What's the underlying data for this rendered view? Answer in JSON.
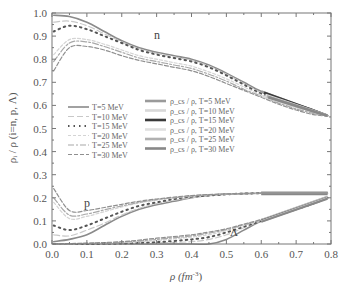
{
  "chart_data": {
    "type": "line",
    "title": "",
    "xlabel": "ρ (fm⁻³)",
    "ylabel": "ρᵢ / ρ (i=n, p, Λ)",
    "xlim": [
      0.0,
      0.8
    ],
    "ylim": [
      0.0,
      1.0
    ],
    "xticks": [
      "0.0",
      "0.1",
      "0.2",
      "0.3",
      "0.4",
      "0.5",
      "0.6",
      "0.7",
      "0.8"
    ],
    "yticks": [
      "0.0",
      "0.1",
      "0.2",
      "0.3",
      "0.4",
      "0.5",
      "0.6",
      "0.7",
      "0.8",
      "0.9",
      "1.0"
    ],
    "grid": false,
    "annotations": [
      {
        "text": "n",
        "x": 0.3,
        "y": 0.915
      },
      {
        "text": "p",
        "x": 0.1,
        "y": 0.175
      },
      {
        "text": "Λ",
        "x": 0.52,
        "y": 0.055
      }
    ],
    "legend_left": [
      {
        "label": "T=5 MeV",
        "style": "solid"
      },
      {
        "label": "T=10 MeV",
        "style": "dash"
      },
      {
        "label": "T=15 MeV",
        "style": "dot"
      },
      {
        "label": "T=20 MeV",
        "style": "short-dash"
      },
      {
        "label": "T=25 MeV",
        "style": "dash-dot"
      },
      {
        "label": "T=30 MeV",
        "style": "dash-long"
      }
    ],
    "legend_right": [
      {
        "label": "ρ_cs / ρ, T=5 MeV"
      },
      {
        "label": "ρ_cs / ρ, T=10 MeV"
      },
      {
        "label": "ρ_cs / ρ, T=15 MeV"
      },
      {
        "label": "ρ_cs / ρ, T=20 MeV"
      },
      {
        "label": "ρ_cs / ρ, T=25 MeV"
      },
      {
        "label": "ρ_cs / ρ, T=30 MeV"
      }
    ],
    "series": [
      {
        "name": "n, T=5 MeV",
        "x": [
          0.005,
          0.05,
          0.1,
          0.15,
          0.2,
          0.25,
          0.3,
          0.35,
          0.4,
          0.45,
          0.5,
          0.55,
          0.6,
          0.65,
          0.7,
          0.75,
          0.79
        ],
        "y": [
          0.99,
          0.985,
          0.96,
          0.92,
          0.88,
          0.85,
          0.83,
          0.815,
          0.8,
          0.775,
          0.74,
          0.7,
          0.66,
          0.63,
          0.605,
          0.58,
          0.555
        ]
      },
      {
        "name": "n, T=10 MeV",
        "x": [
          0.005,
          0.05,
          0.1,
          0.15,
          0.2,
          0.25,
          0.3,
          0.35,
          0.4,
          0.45,
          0.5,
          0.55,
          0.6,
          0.65,
          0.7,
          0.75,
          0.79
        ],
        "y": [
          0.96,
          0.965,
          0.945,
          0.91,
          0.875,
          0.845,
          0.825,
          0.81,
          0.795,
          0.77,
          0.735,
          0.695,
          0.655,
          0.625,
          0.6,
          0.575,
          0.555
        ]
      },
      {
        "name": "n, T=15 MeV",
        "x": [
          0.005,
          0.05,
          0.1,
          0.15,
          0.2,
          0.25,
          0.3,
          0.35,
          0.4,
          0.45,
          0.5,
          0.55,
          0.6,
          0.65,
          0.7,
          0.75,
          0.79
        ],
        "y": [
          0.92,
          0.945,
          0.93,
          0.9,
          0.87,
          0.84,
          0.82,
          0.805,
          0.79,
          0.765,
          0.73,
          0.69,
          0.65,
          0.62,
          0.595,
          0.57,
          0.555
        ]
      },
      {
        "name": "n, T=20 MeV",
        "x": [
          0.005,
          0.05,
          0.1,
          0.15,
          0.2,
          0.25,
          0.3,
          0.35,
          0.4,
          0.45,
          0.5,
          0.55,
          0.6,
          0.65,
          0.7,
          0.75,
          0.79
        ],
        "y": [
          0.82,
          0.885,
          0.885,
          0.865,
          0.84,
          0.815,
          0.8,
          0.785,
          0.77,
          0.745,
          0.715,
          0.68,
          0.645,
          0.615,
          0.59,
          0.565,
          0.555
        ]
      },
      {
        "name": "n, T=25 MeV",
        "x": [
          0.005,
          0.05,
          0.1,
          0.15,
          0.2,
          0.25,
          0.3,
          0.35,
          0.4,
          0.45,
          0.5,
          0.55,
          0.6,
          0.65,
          0.7,
          0.75,
          0.79
        ],
        "y": [
          0.79,
          0.87,
          0.875,
          0.855,
          0.83,
          0.805,
          0.79,
          0.775,
          0.76,
          0.735,
          0.705,
          0.67,
          0.64,
          0.61,
          0.585,
          0.565,
          0.555
        ]
      },
      {
        "name": "n, T=30 MeV",
        "x": [
          0.005,
          0.05,
          0.1,
          0.15,
          0.2,
          0.25,
          0.3,
          0.35,
          0.4,
          0.45,
          0.5,
          0.55,
          0.6,
          0.65,
          0.7,
          0.75,
          0.79
        ],
        "y": [
          0.75,
          0.85,
          0.855,
          0.84,
          0.815,
          0.795,
          0.78,
          0.765,
          0.75,
          0.725,
          0.695,
          0.665,
          0.635,
          0.605,
          0.58,
          0.56,
          0.555
        ]
      },
      {
        "name": "p, T=5 MeV",
        "x": [
          0.005,
          0.05,
          0.1,
          0.15,
          0.2,
          0.25,
          0.3,
          0.35,
          0.4,
          0.45,
          0.5,
          0.55,
          0.6,
          0.65,
          0.7,
          0.75,
          0.79
        ],
        "y": [
          0.01,
          0.02,
          0.04,
          0.08,
          0.12,
          0.15,
          0.17,
          0.185,
          0.2,
          0.21,
          0.215,
          0.218,
          0.22,
          0.22,
          0.22,
          0.22,
          0.22
        ]
      },
      {
        "name": "p, T=10 MeV",
        "x": [
          0.005,
          0.05,
          0.1,
          0.15,
          0.2,
          0.25,
          0.3,
          0.35,
          0.4,
          0.45,
          0.5,
          0.55,
          0.6,
          0.65,
          0.7,
          0.75,
          0.79
        ],
        "y": [
          0.04,
          0.035,
          0.06,
          0.09,
          0.125,
          0.155,
          0.175,
          0.19,
          0.2,
          0.21,
          0.215,
          0.218,
          0.22,
          0.22,
          0.22,
          0.22,
          0.22
        ]
      },
      {
        "name": "p, T=15 MeV",
        "x": [
          0.005,
          0.05,
          0.1,
          0.15,
          0.2,
          0.25,
          0.3,
          0.35,
          0.4,
          0.45,
          0.5,
          0.55,
          0.6,
          0.65,
          0.7,
          0.75,
          0.79
        ],
        "y": [
          0.08,
          0.06,
          0.08,
          0.11,
          0.14,
          0.165,
          0.18,
          0.195,
          0.205,
          0.21,
          0.215,
          0.218,
          0.22,
          0.22,
          0.22,
          0.22,
          0.22
        ]
      },
      {
        "name": "p, T=20 MeV",
        "x": [
          0.005,
          0.05,
          0.1,
          0.15,
          0.2,
          0.25,
          0.3,
          0.35,
          0.4,
          0.45,
          0.5,
          0.55,
          0.6,
          0.65,
          0.7,
          0.75,
          0.79
        ],
        "y": [
          0.18,
          0.11,
          0.12,
          0.14,
          0.16,
          0.178,
          0.19,
          0.2,
          0.207,
          0.212,
          0.216,
          0.218,
          0.22,
          0.22,
          0.22,
          0.22,
          0.22
        ]
      },
      {
        "name": "p, T=25 MeV",
        "x": [
          0.005,
          0.05,
          0.1,
          0.15,
          0.2,
          0.25,
          0.3,
          0.35,
          0.4,
          0.45,
          0.5,
          0.55,
          0.6,
          0.65,
          0.7,
          0.75,
          0.79
        ],
        "y": [
          0.2,
          0.125,
          0.13,
          0.148,
          0.165,
          0.18,
          0.192,
          0.2,
          0.208,
          0.213,
          0.216,
          0.218,
          0.22,
          0.22,
          0.22,
          0.22,
          0.22
        ]
      },
      {
        "name": "p, T=30 MeV",
        "x": [
          0.005,
          0.05,
          0.1,
          0.15,
          0.2,
          0.25,
          0.3,
          0.35,
          0.4,
          0.45,
          0.5,
          0.55,
          0.6,
          0.65,
          0.7,
          0.75,
          0.79
        ],
        "y": [
          0.24,
          0.145,
          0.145,
          0.158,
          0.172,
          0.185,
          0.195,
          0.203,
          0.21,
          0.214,
          0.217,
          0.219,
          0.22,
          0.22,
          0.22,
          0.22,
          0.22
        ]
      },
      {
        "name": "Λ, T=5 MeV",
        "x": [
          0.005,
          0.1,
          0.2,
          0.3,
          0.4,
          0.45,
          0.5,
          0.55,
          0.6,
          0.65,
          0.7,
          0.75,
          0.79
        ],
        "y": [
          0.0,
          0.0,
          0.0,
          0.0,
          0.0,
          0.0,
          0.02,
          0.06,
          0.1,
          0.125,
          0.15,
          0.175,
          0.2
        ]
      },
      {
        "name": "Λ, T=10 MeV",
        "x": [
          0.005,
          0.1,
          0.2,
          0.3,
          0.4,
          0.45,
          0.5,
          0.55,
          0.6,
          0.65,
          0.7,
          0.75,
          0.79
        ],
        "y": [
          0.0,
          0.0,
          0.0,
          0.005,
          0.01,
          0.02,
          0.04,
          0.07,
          0.1,
          0.125,
          0.15,
          0.175,
          0.2
        ]
      },
      {
        "name": "Λ, T=15 MeV",
        "x": [
          0.005,
          0.1,
          0.2,
          0.3,
          0.4,
          0.45,
          0.5,
          0.55,
          0.6,
          0.65,
          0.7,
          0.75,
          0.79
        ],
        "y": [
          0.0,
          0.0,
          0.002,
          0.008,
          0.02,
          0.03,
          0.05,
          0.075,
          0.1,
          0.125,
          0.15,
          0.175,
          0.2
        ]
      },
      {
        "name": "Λ, T=20 MeV",
        "x": [
          0.005,
          0.1,
          0.2,
          0.3,
          0.4,
          0.45,
          0.5,
          0.55,
          0.6,
          0.65,
          0.7,
          0.75,
          0.79
        ],
        "y": [
          0.0,
          0.002,
          0.006,
          0.015,
          0.03,
          0.04,
          0.058,
          0.08,
          0.102,
          0.126,
          0.15,
          0.175,
          0.2
        ]
      },
      {
        "name": "Λ, T=25 MeV",
        "x": [
          0.005,
          0.1,
          0.2,
          0.3,
          0.4,
          0.45,
          0.5,
          0.55,
          0.6,
          0.65,
          0.7,
          0.75,
          0.79
        ],
        "y": [
          0.0,
          0.003,
          0.008,
          0.02,
          0.035,
          0.047,
          0.062,
          0.083,
          0.104,
          0.127,
          0.15,
          0.175,
          0.2
        ]
      },
      {
        "name": "Λ, T=30 MeV",
        "x": [
          0.005,
          0.1,
          0.2,
          0.3,
          0.4,
          0.45,
          0.5,
          0.55,
          0.6,
          0.65,
          0.7,
          0.75,
          0.79
        ],
        "y": [
          0.0,
          0.004,
          0.01,
          0.025,
          0.04,
          0.052,
          0.066,
          0.086,
          0.106,
          0.128,
          0.15,
          0.175,
          0.2
        ]
      }
    ],
    "cs_segments": {
      "n": {
        "x": [
          0.6,
          0.79
        ],
        "y_start": [
          0.66,
          0.64,
          0.655,
          0.645,
          0.64,
          0.635
        ],
        "y_end": 0.555
      },
      "p": {
        "x": [
          0.6,
          0.79
        ],
        "y": 0.22
      },
      "L": {
        "x": [
          0.6,
          0.79
        ],
        "y_start": 0.1,
        "y_end": 0.2
      }
    }
  },
  "labels": {
    "ylabel": "ρᵢ / ρ (i=n, p, Λ)",
    "xlabel_main": "ρ (fm",
    "xlabel_sup": "-3",
    "xlabel_close": ")",
    "ann_n": "n",
    "ann_p": "p",
    "ann_L": "Λ"
  }
}
